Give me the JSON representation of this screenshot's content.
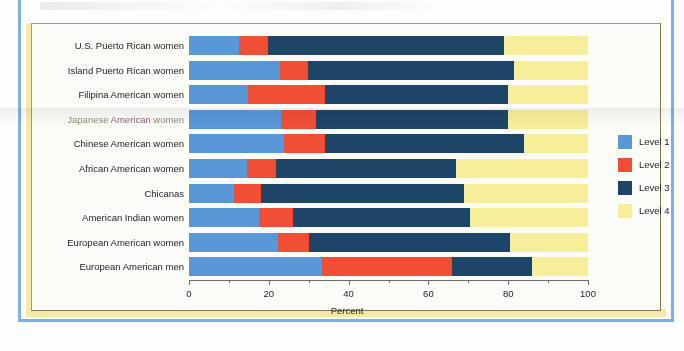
{
  "chart_data": {
    "type": "bar",
    "orientation": "horizontal",
    "stacked": true,
    "stack_mode": "percent",
    "title": "",
    "xlabel": "Percent",
    "ylabel": "",
    "xlim": [
      0,
      100
    ],
    "xticks": [
      0,
      20,
      40,
      60,
      80,
      100
    ],
    "xtick_labels": [
      "0",
      "20",
      "40",
      "60",
      "80",
      "100"
    ],
    "minor_xticks": [
      10,
      30,
      50,
      70,
      90
    ],
    "grid": false,
    "legend_position": "right",
    "categories": [
      "U.S. Puerto Rican women",
      "Island Puerto Rican women",
      "Filipina American women",
      "Japanese American women",
      "Chinese American women",
      "African American women",
      "Chicanas",
      "American Indian women",
      "European American women",
      "European American men"
    ],
    "series": [
      {
        "name": "Level 1",
        "color": "#5a97d6",
        "values": [
          12.5,
          22.8,
          14.8,
          23.0,
          23.8,
          14.5,
          11.3,
          17.5,
          22.3,
          33.3
        ]
      },
      {
        "name": "Level 2",
        "color": "#f04e35",
        "values": [
          7.3,
          7.0,
          19.2,
          8.8,
          10.2,
          7.3,
          6.7,
          8.5,
          7.7,
          32.7
        ]
      },
      {
        "name": "Level 3",
        "color": "#1d4568",
        "values": [
          59.2,
          51.7,
          46.0,
          48.2,
          50.0,
          45.2,
          51.0,
          44.5,
          50.5,
          20.0
        ]
      },
      {
        "name": "Level 4",
        "color": "#f7ee9b",
        "values": [
          21.0,
          18.5,
          20.0,
          20.0,
          16.0,
          33.0,
          31.0,
          29.5,
          19.5,
          14.0
        ]
      }
    ]
  },
  "legend": {
    "items": [
      {
        "label": "Level 1",
        "color": "#5a97d6"
      },
      {
        "label": "Level 2",
        "color": "#f04e35"
      },
      {
        "label": "Level 3",
        "color": "#1d4568"
      },
      {
        "label": "Level 4",
        "color": "#f7ee9b"
      }
    ]
  },
  "axis": {
    "title": "Percent",
    "tick_labels": [
      "0",
      "20",
      "40",
      "60",
      "80",
      "100"
    ]
  },
  "colors": {
    "level1": "#5a97d6",
    "level2": "#f04e35",
    "level3": "#1d4568",
    "level4": "#f7ee9b",
    "panel_background": "#fbfbf8",
    "panel_border": "#8a7a4a",
    "page_accent_blue": "#7eb0e5",
    "page_accent_yellow": "#f6e9a8",
    "text": "#23252a"
  }
}
